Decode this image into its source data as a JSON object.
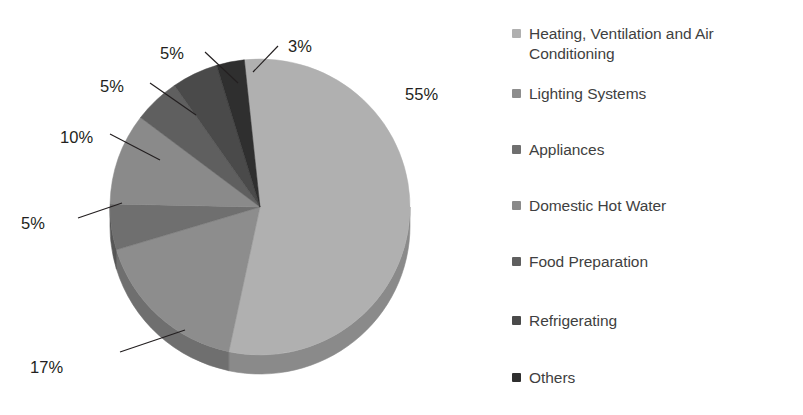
{
  "chart_data": {
    "type": "pie",
    "title": "",
    "subtitle": "",
    "xlabel": "",
    "ylabel": "",
    "legend_position": "right",
    "grid": false,
    "three_d": true,
    "categories": [
      "Heating, Ventilation and Air Conditioning",
      "Lighting Systems",
      "Appliances",
      "Domestic Hot Water",
      "Food Preparation",
      "Refrigerating",
      "Others"
    ],
    "values": [
      55,
      17,
      5,
      10,
      5,
      5,
      3
    ],
    "data_labels": [
      "55%",
      "17%",
      "5%",
      "10%",
      "5%",
      "5%",
      "3%"
    ],
    "colors": [
      "#b0b0b0",
      "#8d8d8d",
      "#6f6f6f",
      "#8a8a8a",
      "#5f5f5f",
      "#4a4a4a",
      "#2f2f2f"
    ],
    "side_colors": [
      "#8a8a8a",
      "#6f6f6f",
      "#565656",
      "#6b6b6b",
      "#4a4a4a",
      "#3a3a3a",
      "#242424"
    ],
    "total": 100,
    "units": "%"
  },
  "slice_labels": [
    {
      "text": "55%",
      "x": 405,
      "y": 85,
      "leader": false
    },
    {
      "text": "17%",
      "x": 30,
      "y": 358,
      "leader": true
    },
    {
      "text": "5%",
      "x": 21,
      "y": 214,
      "leader": true
    },
    {
      "text": "10%",
      "x": 60,
      "y": 128,
      "leader": true
    },
    {
      "text": "5%",
      "x": 100,
      "y": 77,
      "leader": true
    },
    {
      "text": "5%",
      "x": 160,
      "y": 44,
      "leader": true
    },
    {
      "text": "3%",
      "x": 288,
      "y": 37,
      "leader": true
    }
  ],
  "legend": {
    "items": [
      {
        "label": "Heating, Ventilation and Air Conditioning",
        "color": "#b0b0b0",
        "top": 24
      },
      {
        "label": "Lighting Systems",
        "color": "#8d8d8d",
        "top": 84
      },
      {
        "label": "Appliances",
        "color": "#6f6f6f",
        "top": 140
      },
      {
        "label": "Domestic Hot Water",
        "color": "#8a8a8a",
        "top": 196
      },
      {
        "label": "Food Preparation",
        "color": "#5f5f5f",
        "top": 252
      },
      {
        "label": "Refrigerating",
        "color": "#4a4a4a",
        "top": 311
      },
      {
        "label": "Others",
        "color": "#2f2f2f",
        "top": 368
      }
    ]
  },
  "geometry": {
    "cx": 260,
    "cy": 207,
    "rx": 150,
    "ry": 148,
    "depth": 19,
    "start_angle_deg": -96
  }
}
